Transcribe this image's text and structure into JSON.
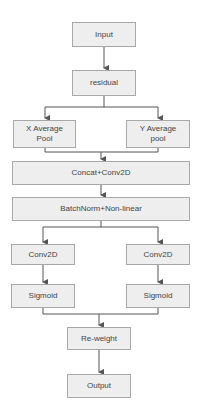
{
  "diagram": {
    "type": "flowchart",
    "nodes": {
      "input": "Input",
      "residual": "residual",
      "x_avg_pool": "X Average Pool",
      "y_avg_pool": "Y Average pool",
      "concat_conv": "Concat+Conv2D",
      "batchnorm": "BatchNorm+Non-linear",
      "conv_left": "Conv2D",
      "conv_right": "Conv2D",
      "sigmoid_left": "Sigmoid",
      "sigmoid_right": "Sigmoid",
      "reweight": "Re-weight",
      "output": "Output"
    },
    "edges": [
      [
        "input",
        "residual"
      ],
      [
        "residual",
        "x_avg_pool"
      ],
      [
        "residual",
        "y_avg_pool"
      ],
      [
        "x_avg_pool",
        "concat_conv"
      ],
      [
        "y_avg_pool",
        "concat_conv"
      ],
      [
        "concat_conv",
        "batchnorm"
      ],
      [
        "batchnorm",
        "conv_left"
      ],
      [
        "batchnorm",
        "conv_right"
      ],
      [
        "conv_left",
        "sigmoid_left"
      ],
      [
        "conv_right",
        "sigmoid_right"
      ],
      [
        "sigmoid_left",
        "reweight"
      ],
      [
        "sigmoid_right",
        "reweight"
      ],
      [
        "reweight",
        "output"
      ]
    ],
    "colors": {
      "node_fill": "#eeeeee",
      "node_border": "#a8a8a8",
      "arrow": "#555555",
      "text": "#444444"
    }
  }
}
